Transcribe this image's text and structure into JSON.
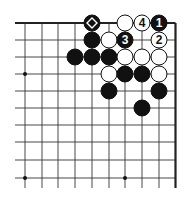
{
  "diagram": {
    "type": "go-board-fragment",
    "colors": {
      "background": "#ffffff",
      "line": "#333333",
      "edge": "#222222",
      "black_stone": "#111111",
      "white_stone": "#ffffff",
      "stone_outline": "#111111"
    },
    "grid": {
      "columns_x": [
        25,
        42,
        58,
        75,
        92,
        109,
        125,
        142,
        159,
        175.5
      ],
      "rows_y": [
        23,
        40,
        57,
        74,
        91,
        108,
        125,
        142,
        160,
        178
      ],
      "line_left_x": 15,
      "line_bottom_y": 188,
      "top_edge": true,
      "right_edge": true
    },
    "star_points": [
      {
        "col": 0,
        "row": 3
      },
      {
        "col": 0,
        "row": 9
      },
      {
        "col": 6,
        "row": 9
      }
    ],
    "stones": [
      {
        "color": "black",
        "col": 4,
        "row": 0,
        "marker": "diamond"
      },
      {
        "color": "white",
        "col": 6,
        "row": 0
      },
      {
        "color": "white",
        "col": 7,
        "row": 0,
        "label": "4"
      },
      {
        "color": "black",
        "col": 8,
        "row": 0,
        "label": "1"
      },
      {
        "color": "black",
        "col": 4,
        "row": 1
      },
      {
        "color": "white",
        "col": 5,
        "row": 1
      },
      {
        "color": "black",
        "col": 6,
        "row": 1,
        "label": "3"
      },
      {
        "color": "white",
        "col": 8,
        "row": 1,
        "label": "2"
      },
      {
        "color": "black",
        "col": 3,
        "row": 2
      },
      {
        "color": "black",
        "col": 4,
        "row": 2
      },
      {
        "color": "black",
        "col": 5,
        "row": 2
      },
      {
        "color": "white",
        "col": 6,
        "row": 2
      },
      {
        "color": "white",
        "col": 7,
        "row": 2
      },
      {
        "color": "white",
        "col": 8,
        "row": 2
      },
      {
        "color": "white",
        "col": 5,
        "row": 3
      },
      {
        "color": "black",
        "col": 6,
        "row": 3
      },
      {
        "color": "black",
        "col": 7,
        "row": 3
      },
      {
        "color": "white",
        "col": 8,
        "row": 3
      },
      {
        "color": "black",
        "col": 5,
        "row": 4
      },
      {
        "color": "black",
        "col": 8,
        "row": 4
      },
      {
        "color": "black",
        "col": 7,
        "row": 5
      }
    ],
    "move_labels": [
      "1",
      "2",
      "3",
      "4"
    ]
  }
}
